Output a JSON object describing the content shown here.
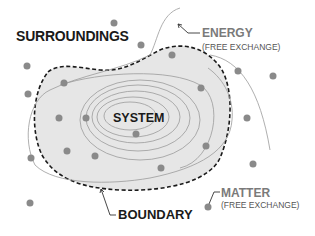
{
  "diagram": {
    "labels": {
      "surroundings": "SURROUNDINGS",
      "system": "SYSTEM",
      "boundary": "BOUNDARY",
      "energy": "ENERGY",
      "energy_sub": "(FREE EXCHANGE)",
      "matter": "MATTER",
      "matter_sub": "(FREE EXCHANGE)"
    },
    "colors": {
      "system_fill": "#e6e6e6",
      "boundary_stroke": "#1a1a1a",
      "particle": "#8a8a8a",
      "energy_line": "#9a9a9a",
      "energy_label": "#7a7a7a",
      "matter_label": "#7a7a7a"
    },
    "particles_count": 21
  }
}
